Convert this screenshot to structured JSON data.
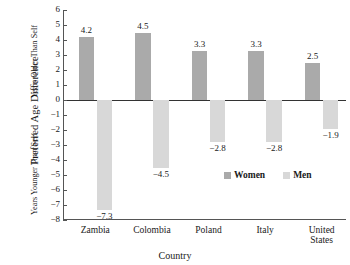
{
  "chart_data": {
    "type": "bar",
    "title": "",
    "subtitle": "",
    "xlabel": "Country",
    "ylabel": "Preferred Age Difference",
    "ylabel_upper": "Years Older Than Self",
    "ylabel_lower": "Years Younger Than Self",
    "categories": [
      "Zambia",
      "Colombia",
      "Poland",
      "Italy",
      "United States"
    ],
    "series": [
      {
        "name": "Women",
        "color": "#aaaaaa",
        "values": [
          4.2,
          4.5,
          3.3,
          3.3,
          2.5
        ],
        "labels": [
          "4.2",
          "4.5",
          "3.3",
          "3.3",
          "2.5"
        ]
      },
      {
        "name": "Men",
        "color": "#d8d8d8",
        "values": [
          -7.3,
          -4.5,
          -2.8,
          -2.8,
          -1.9
        ],
        "labels": [
          "−7.3",
          "−4.5",
          "−2.8",
          "−2.8",
          "−1.9"
        ]
      }
    ],
    "ylim": [
      -8,
      6
    ],
    "yticks": [
      6,
      5,
      4,
      3,
      2,
      1,
      0,
      -1,
      -2,
      -3,
      -4,
      -5,
      -6,
      -7,
      -8
    ],
    "ytick_labels": [
      "6",
      "5",
      "4",
      "3",
      "2",
      "1",
      "0",
      "−1",
      "−2",
      "−3",
      "−4",
      "−5",
      "−6",
      "−7",
      "−8"
    ],
    "grid": false,
    "legend_position": "inside-lower-right",
    "zero_line": 0
  },
  "legend": {
    "items": [
      {
        "label": "Women",
        "color": "#aaaaaa"
      },
      {
        "label": "Men",
        "color": "#d8d8d8"
      }
    ]
  }
}
